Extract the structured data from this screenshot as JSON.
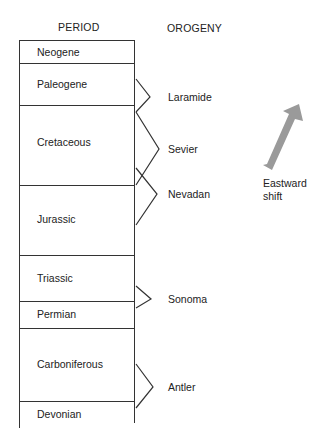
{
  "headers": {
    "period": "PERIOD",
    "orogeny": "OROGENY"
  },
  "periods": [
    {
      "name": "Neogene",
      "label_y": 46
    },
    {
      "name": "Paleogene",
      "label_y": 77
    },
    {
      "name": "Cretaceous",
      "label_y": 136
    },
    {
      "name": "Jurassic",
      "label_y": 213
    },
    {
      "name": "Triassic",
      "label_y": 272
    },
    {
      "name": "Permian",
      "label_y": 308
    },
    {
      "name": "Carboniferous",
      "label_y": 358
    },
    {
      "name": "Devonian",
      "label_y": 408
    }
  ],
  "orogenies": [
    {
      "name": "Laramide",
      "label_y": 91
    },
    {
      "name": "Sevier",
      "label_y": 143
    },
    {
      "name": "Nevadan",
      "label_y": 188
    },
    {
      "name": "Sonoma",
      "label_y": 293
    },
    {
      "name": "Antler",
      "label_y": 381
    }
  ],
  "annotation": {
    "line1": "Eastward",
    "line2": "shift"
  },
  "colors": {
    "line": "#333333",
    "arrow": "#9a9a9a"
  }
}
